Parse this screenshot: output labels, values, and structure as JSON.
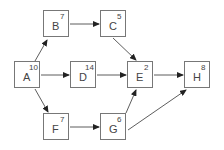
{
  "diagram": {
    "type": "activity-network",
    "nodes": [
      {
        "id": "A",
        "label": "A",
        "duration": "10",
        "x": 14,
        "y": 61
      },
      {
        "id": "B",
        "label": "B",
        "duration": "7",
        "x": 43,
        "y": 10
      },
      {
        "id": "C",
        "label": "C",
        "duration": "5",
        "x": 100,
        "y": 10
      },
      {
        "id": "D",
        "label": "D",
        "duration": "14",
        "x": 70,
        "y": 61
      },
      {
        "id": "E",
        "label": "E",
        "duration": "2",
        "x": 127,
        "y": 61
      },
      {
        "id": "F",
        "label": "F",
        "duration": "7",
        "x": 43,
        "y": 113
      },
      {
        "id": "G",
        "label": "G",
        "duration": "6",
        "x": 100,
        "y": 113
      },
      {
        "id": "H",
        "label": "H",
        "duration": "8",
        "x": 184,
        "y": 61
      }
    ],
    "edges": [
      {
        "from": "A",
        "to": "B"
      },
      {
        "from": "A",
        "to": "D"
      },
      {
        "from": "A",
        "to": "F"
      },
      {
        "from": "B",
        "to": "C"
      },
      {
        "from": "C",
        "to": "E"
      },
      {
        "from": "D",
        "to": "E"
      },
      {
        "from": "F",
        "to": "G"
      },
      {
        "from": "G",
        "to": "E"
      },
      {
        "from": "E",
        "to": "H"
      },
      {
        "from": "G",
        "to": "H"
      }
    ],
    "colors": {
      "stroke": "#777777",
      "text": "#444444",
      "background": "#ffffff"
    }
  }
}
